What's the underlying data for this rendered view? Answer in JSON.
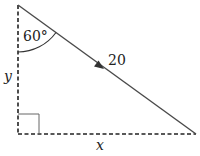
{
  "diagram": {
    "type": "right-triangle",
    "labels": {
      "angle": "60°",
      "hypotenuse": "20",
      "vertical_side": "y",
      "horizontal_side": "x"
    },
    "colors": {
      "line": "#4a4a4a",
      "dashed": "#222222",
      "text": "#222222"
    }
  }
}
